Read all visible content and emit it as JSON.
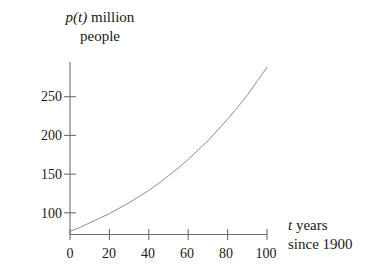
{
  "chart_data": {
    "type": "line",
    "title": "",
    "ylabel_line1_prefix": "p(t)",
    "ylabel_line1_suffix": " million",
    "ylabel_line2": "people",
    "ylabel_full": "p(t) million people",
    "xlabel_line1_prefix": "t",
    "xlabel_line1_suffix": " years",
    "xlabel_line2": "since 1900",
    "xlabel_full": "t years since 1900",
    "xticks": [
      0,
      20,
      40,
      60,
      80,
      100
    ],
    "xtick_labels": [
      "0",
      "20",
      "40",
      "60",
      "80",
      "100"
    ],
    "yticks": [
      100,
      150,
      200,
      250
    ],
    "ytick_labels": [
      "100",
      "150",
      "200",
      "250"
    ],
    "xlim": [
      0,
      100
    ],
    "ylim": [
      0,
      290
    ],
    "grid": false,
    "legend": null,
    "series": [
      {
        "name": "p(t)",
        "color": "#8c8c8c",
        "x": [
          0,
          5,
          10,
          15,
          20,
          25,
          30,
          35,
          40,
          45,
          50,
          55,
          60,
          65,
          70,
          75,
          80,
          85,
          90,
          95,
          100
        ],
        "y": [
          76,
          81,
          87,
          93,
          99,
          106,
          113,
          121,
          129,
          138,
          148,
          158,
          169,
          181,
          193,
          207,
          221,
          236,
          252,
          270,
          288
        ]
      }
    ],
    "curve_color": "#8c8c8c",
    "axis_color": "#6e6e6e",
    "background": "#ffffff"
  }
}
